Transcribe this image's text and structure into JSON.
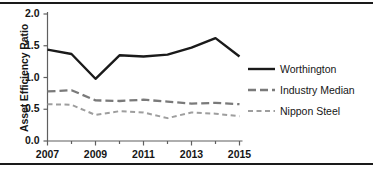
{
  "figure": {
    "axis_title_y": "Asset Efficiency Ratio",
    "rule_color": "#1a1a1a"
  },
  "legend": {
    "items": [
      {
        "label": "Worthington",
        "style": "solid",
        "color": "#1a1a1a",
        "icon": "solid-line-icon"
      },
      {
        "label": "Industry Median",
        "style": "long-dash",
        "color": "#7a7a7a",
        "icon": "dashed-line-icon"
      },
      {
        "label": "Nippon Steel",
        "style": "short-dash",
        "color": "#9e9e9e",
        "icon": "dotted-line-icon"
      }
    ]
  },
  "chart_data": {
    "type": "line",
    "title": "",
    "xlabel": "",
    "ylabel": "Asset Efficiency Ratio",
    "x": [
      2007,
      2008,
      2009,
      2010,
      2011,
      2012,
      2013,
      2014,
      2015
    ],
    "xtick_labels": [
      "2007",
      "2009",
      "2011",
      "2013",
      "2015"
    ],
    "xticks": [
      2007,
      2009,
      2011,
      2013,
      2015
    ],
    "xlim": [
      2007,
      2015
    ],
    "ytick_labels": [
      "0.0",
      "0.5",
      "1.0",
      "1.5",
      "2.0"
    ],
    "yticks": [
      0.0,
      0.5,
      1.0,
      1.5,
      2.0
    ],
    "ylim": [
      0.0,
      2.0
    ],
    "grid": false,
    "legend_position": "right",
    "series": [
      {
        "name": "Worthington",
        "color": "#1a1a1a",
        "style": "solid",
        "values": [
          1.44,
          1.37,
          0.98,
          1.35,
          1.33,
          1.36,
          1.47,
          1.62,
          1.33
        ]
      },
      {
        "name": "Industry Median",
        "color": "#7a7a7a",
        "style": "long-dash",
        "values": [
          0.78,
          0.8,
          0.64,
          0.63,
          0.65,
          0.62,
          0.59,
          0.6,
          0.58
        ]
      },
      {
        "name": "Nippon Steel",
        "color": "#9e9e9e",
        "style": "short-dash",
        "values": [
          0.58,
          0.57,
          0.41,
          0.47,
          0.45,
          0.36,
          0.45,
          0.43,
          0.39
        ]
      }
    ]
  }
}
